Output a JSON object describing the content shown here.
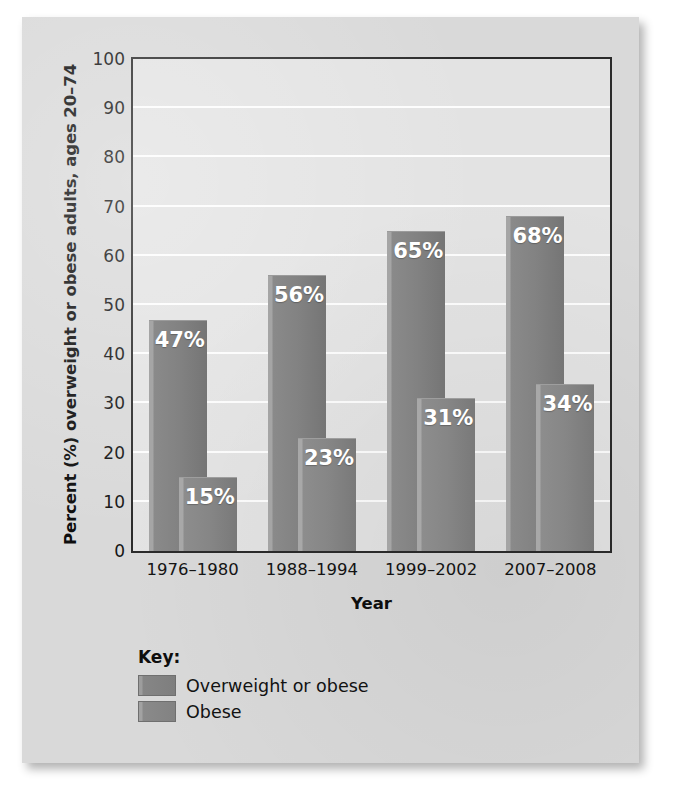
{
  "chart_data": {
    "type": "bar",
    "title": "",
    "subtitle": "",
    "xlabel": "Year",
    "ylabel": "Percent (%) overweight or obese adults, ages 20–74",
    "categories": [
      "1976–1980",
      "1988–1994",
      "1999–2002",
      "2007–2008"
    ],
    "series": [
      {
        "name": "Overweight or obese",
        "values": [
          47,
          56,
          65,
          68
        ],
        "labels": [
          "47%",
          "56%",
          "65%",
          "68%"
        ],
        "color": "#828282"
      },
      {
        "name": "Obese",
        "values": [
          15,
          23,
          31,
          34
        ],
        "labels": [
          "15%",
          "23%",
          "31%",
          "34%"
        ],
        "color": "#868686"
      }
    ],
    "ylim": [
      0,
      100
    ],
    "ytick_values": [
      0,
      10,
      20,
      30,
      40,
      50,
      60,
      70,
      80,
      90,
      100
    ],
    "ytick_labels": [
      "0",
      "10",
      "20",
      "30",
      "40",
      "50",
      "60",
      "70",
      "80",
      "90",
      "100"
    ],
    "grid": true,
    "grid_axis": "y",
    "legend_position": "below-left",
    "plot_background": "#e3e3e3",
    "gridline_color": "#fdfdfd",
    "axis_color": "#2b2b2b"
  },
  "legend": {
    "title": "Key:",
    "entries": [
      {
        "label": "Overweight or obese",
        "swatch": "#828282"
      },
      {
        "label": "Obese",
        "swatch": "#868686"
      }
    ]
  }
}
